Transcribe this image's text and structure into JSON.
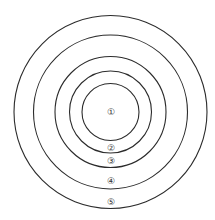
{
  "diagram": {
    "type": "concentric-circles",
    "center": {
      "x": 110.5,
      "y": 112
    },
    "stroke_color": "#2b2b2b",
    "background": "#ffffff",
    "rings": [
      {
        "id": 1,
        "label": "①",
        "radius": 28.5,
        "label_y": 112
      },
      {
        "id": 2,
        "label": "②",
        "radius": 41,
        "label_y": 148
      },
      {
        "id": 3,
        "label": "③",
        "radius": 55.5,
        "label_y": 161
      },
      {
        "id": 4,
        "label": "④",
        "radius": 77,
        "label_y": 181
      },
      {
        "id": 5,
        "label": "⑤",
        "radius": 96.5,
        "label_y": 202
      }
    ]
  },
  "caption": {
    "text": ""
  }
}
